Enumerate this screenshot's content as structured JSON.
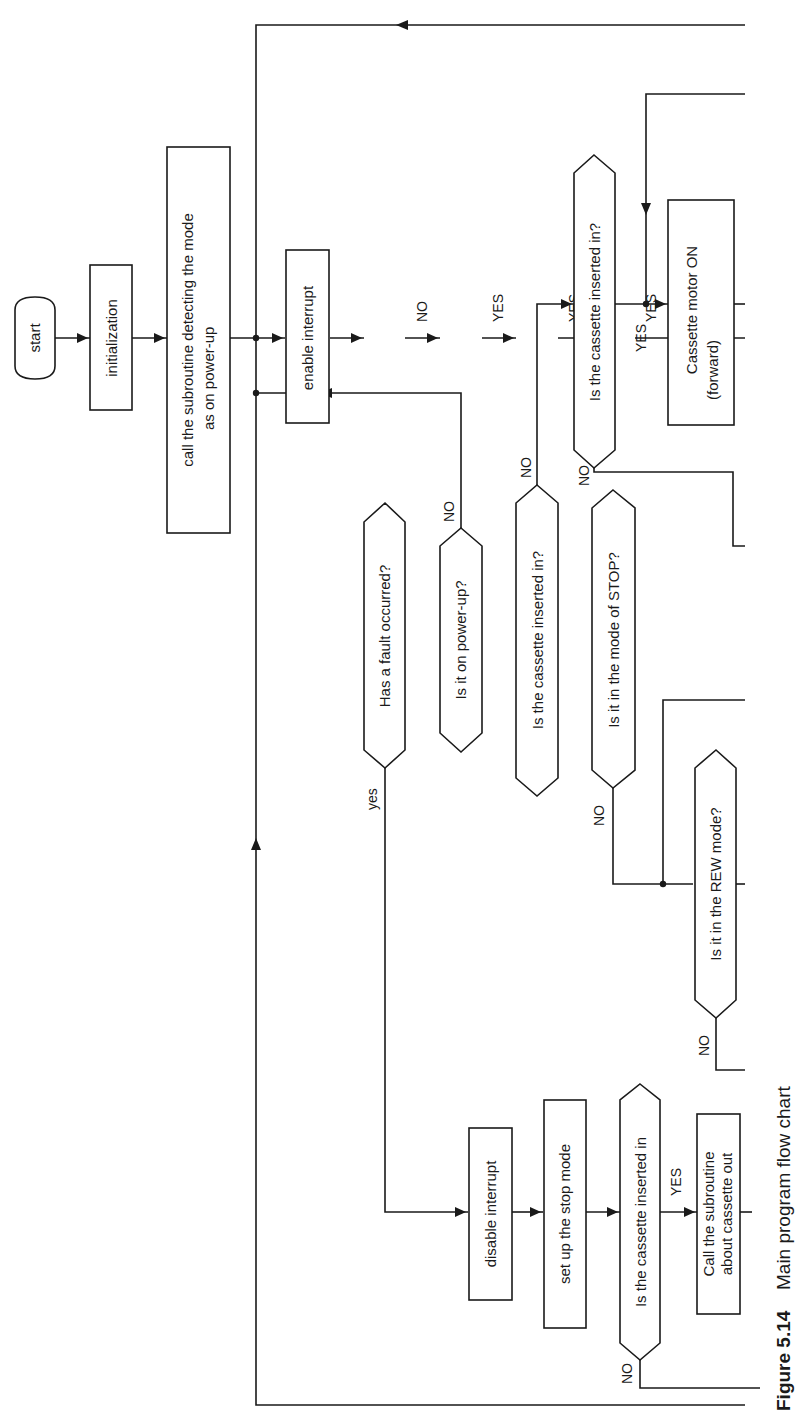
{
  "figure": {
    "caption_number": "Figure 5.14",
    "caption_title": "Main program flow chart",
    "orientation": "rotated 90° counter-clockwise"
  },
  "nodes": {
    "start": "start",
    "initialization": "initialization",
    "call_detect_1": "call the subroutine detecting the mode",
    "call_detect_2": "as on power-up",
    "enable_interrupt": "enable interrupt",
    "fault_question": "Has a fault occurred?",
    "powerup_question": "Is it on power-up?",
    "cassette_question_1": "Is the cassette inserted in?",
    "cassette_question_2": "Is the cassette inserted in?",
    "motor_on_1": "Cassette motor ON",
    "motor_on_2": "(forward)",
    "stop_question": "Is it in the mode of STOP?",
    "rew_question": "Is it in the REW mode?",
    "disable_interrupt": "disable interrupt",
    "set_stop_mode": "set up the stop mode",
    "cassette_question_3": "Is the cassette inserted in",
    "call_out_1": "Call the subroutine",
    "call_out_2": "about cassette out"
  },
  "edge_labels": {
    "fault_no": "NO",
    "fault_yes": "yes",
    "powerup_no": "NO",
    "powerup_yes": "YES",
    "cassette1_yes": "YES",
    "cassette1_no": "NO",
    "cassette2_yes": "YES",
    "cassette2_no": "NO",
    "stop_yes": "YES",
    "stop_no": "NO",
    "rew_no": "NO",
    "cassette3_yes": "YES",
    "cassette3_no": "NO"
  }
}
